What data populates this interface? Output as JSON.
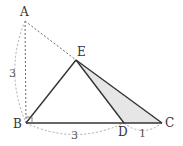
{
  "diagram": {
    "type": "geometry-figure",
    "points": {
      "A": {
        "label": "A",
        "x": 25,
        "y": 21
      },
      "B": {
        "label": "B",
        "x": 26,
        "y": 123
      },
      "C": {
        "label": "C",
        "x": 162,
        "y": 123
      },
      "D": {
        "label": "D",
        "x": 124,
        "y": 123
      },
      "E": {
        "label": "E",
        "x": 76,
        "y": 60
      }
    },
    "lengths": {
      "AB": "3",
      "BD": "3",
      "DC": "1"
    },
    "shaded_region": "triangle EDC",
    "right_angle_at": "B",
    "colors": {
      "solid_line": "#333333",
      "dashed_line": "#666666",
      "arc_line": "#aaaaaa",
      "shade": "#e6e6e6"
    }
  }
}
